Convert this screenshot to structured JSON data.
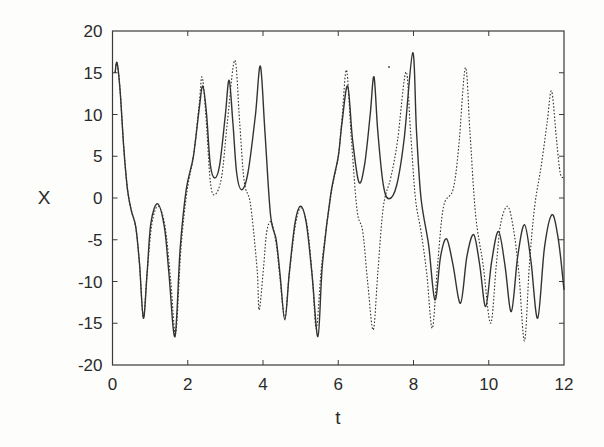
{
  "chart_data": {
    "type": "line",
    "title": "",
    "xlabel": "t",
    "ylabel": "X",
    "xlim": [
      0,
      12
    ],
    "ylim": [
      -20,
      20
    ],
    "xticks": [
      0,
      2,
      4,
      6,
      8,
      10,
      12
    ],
    "yticks": [
      -20,
      -15,
      -10,
      -5,
      0,
      5,
      10,
      15,
      20
    ],
    "xtick_labels": [
      "0",
      "2",
      "4",
      "6",
      "8",
      "10",
      "12"
    ],
    "ytick_labels": [
      "-20",
      "-15",
      "-10",
      "-5",
      "0",
      "5",
      "10",
      "15",
      "20"
    ],
    "grid": false,
    "legend": null,
    "series": [
      {
        "name": "solid",
        "style": "solid",
        "color": "#333333",
        "points": [
          [
            0.07,
            15.0
          ],
          [
            0.12,
            16.2
          ],
          [
            0.2,
            13.0
          ],
          [
            0.3,
            6.0
          ],
          [
            0.4,
            1.0
          ],
          [
            0.5,
            -1.5
          ],
          [
            0.62,
            -3.5
          ],
          [
            0.72,
            -8.0
          ],
          [
            0.82,
            -14.4
          ],
          [
            0.92,
            -9.0
          ],
          [
            1.02,
            -3.0
          ],
          [
            1.2,
            -0.7
          ],
          [
            1.38,
            -3.5
          ],
          [
            1.5,
            -9.0
          ],
          [
            1.66,
            -16.6
          ],
          [
            1.8,
            -6.0
          ],
          [
            1.96,
            1.0
          ],
          [
            2.15,
            5.0
          ],
          [
            2.3,
            10.5
          ],
          [
            2.4,
            13.4
          ],
          [
            2.5,
            10.0
          ],
          [
            2.6,
            4.0
          ],
          [
            2.72,
            2.4
          ],
          [
            2.85,
            4.0
          ],
          [
            3.0,
            10.0
          ],
          [
            3.1,
            14.1
          ],
          [
            3.2,
            9.0
          ],
          [
            3.3,
            3.0
          ],
          [
            3.43,
            1.0
          ],
          [
            3.6,
            3.0
          ],
          [
            3.8,
            10.0
          ],
          [
            3.93,
            15.8
          ],
          [
            4.05,
            8.0
          ],
          [
            4.2,
            -2.0
          ],
          [
            4.35,
            -5.0
          ],
          [
            4.45,
            -9.0
          ],
          [
            4.58,
            -14.6
          ],
          [
            4.7,
            -9.0
          ],
          [
            4.85,
            -3.0
          ],
          [
            5.0,
            -1.0
          ],
          [
            5.15,
            -3.0
          ],
          [
            5.3,
            -9.0
          ],
          [
            5.46,
            -16.6
          ],
          [
            5.58,
            -8.0
          ],
          [
            5.8,
            0.4
          ],
          [
            6.0,
            5.0
          ],
          [
            6.1,
            9.0
          ],
          [
            6.25,
            13.4
          ],
          [
            6.38,
            7.0
          ],
          [
            6.55,
            1.9
          ],
          [
            6.7,
            4.0
          ],
          [
            6.85,
            10.0
          ],
          [
            6.95,
            14.5
          ],
          [
            7.05,
            8.0
          ],
          [
            7.2,
            1.5
          ],
          [
            7.35,
            -0.1
          ],
          [
            7.55,
            1.5
          ],
          [
            7.75,
            7.0
          ],
          [
            7.98,
            17.4
          ],
          [
            8.08,
            8.0
          ],
          [
            8.2,
            0.0
          ],
          [
            8.4,
            -5.6
          ],
          [
            8.57,
            -12.2
          ],
          [
            8.72,
            -7.0
          ],
          [
            8.88,
            -4.9
          ],
          [
            9.05,
            -8.0
          ],
          [
            9.25,
            -12.6
          ],
          [
            9.42,
            -7.0
          ],
          [
            9.6,
            -4.4
          ],
          [
            9.76,
            -8.0
          ],
          [
            9.92,
            -13.0
          ],
          [
            10.08,
            -7.5
          ],
          [
            10.26,
            -4.0
          ],
          [
            10.43,
            -8.0
          ],
          [
            10.6,
            -13.6
          ],
          [
            10.77,
            -7.0
          ],
          [
            10.95,
            -3.2
          ],
          [
            11.12,
            -7.5
          ],
          [
            11.3,
            -14.4
          ],
          [
            11.48,
            -6.0
          ],
          [
            11.68,
            -2.0
          ],
          [
            11.85,
            -5.0
          ],
          [
            12.0,
            -11.0
          ]
        ]
      },
      {
        "name": "dotted",
        "style": "dotted",
        "color": "#333333",
        "points": [
          [
            0.07,
            15.0
          ],
          [
            0.12,
            16.2
          ],
          [
            0.2,
            13.0
          ],
          [
            0.3,
            6.0
          ],
          [
            0.4,
            1.0
          ],
          [
            0.5,
            -1.5
          ],
          [
            0.62,
            -3.5
          ],
          [
            0.72,
            -8.0
          ],
          [
            0.82,
            -14.3
          ],
          [
            0.92,
            -9.0
          ],
          [
            1.05,
            -3.0
          ],
          [
            1.22,
            -1.0
          ],
          [
            1.4,
            -3.5
          ],
          [
            1.55,
            -10.0
          ],
          [
            1.68,
            -16.2
          ],
          [
            1.82,
            -6.0
          ],
          [
            1.98,
            0.8
          ],
          [
            2.15,
            5.0
          ],
          [
            2.3,
            11.0
          ],
          [
            2.38,
            14.5
          ],
          [
            2.48,
            10.0
          ],
          [
            2.6,
            2.0
          ],
          [
            2.72,
            0.4
          ],
          [
            2.9,
            2.5
          ],
          [
            3.05,
            9.0
          ],
          [
            3.25,
            16.5
          ],
          [
            3.38,
            9.0
          ],
          [
            3.5,
            2.0
          ],
          [
            3.65,
            -0.3
          ],
          [
            3.75,
            -4.0
          ],
          [
            3.85,
            -9.0
          ],
          [
            3.9,
            -13.4
          ],
          [
            4.02,
            -8.0
          ],
          [
            4.1,
            -4.0
          ],
          [
            4.22,
            -2.9
          ],
          [
            4.35,
            -5.5
          ],
          [
            4.45,
            -9.5
          ],
          [
            4.58,
            -14.4
          ],
          [
            4.7,
            -9.0
          ],
          [
            4.87,
            -3.0
          ],
          [
            5.02,
            -1.2
          ],
          [
            5.18,
            -3.5
          ],
          [
            5.32,
            -10.0
          ],
          [
            5.42,
            -15.6
          ],
          [
            5.56,
            -8.0
          ],
          [
            5.8,
            0.2
          ],
          [
            6.0,
            5.0
          ],
          [
            6.1,
            9.5
          ],
          [
            6.22,
            15.3
          ],
          [
            6.35,
            7.0
          ],
          [
            6.5,
            -1.5
          ],
          [
            6.65,
            -4.0
          ],
          [
            6.78,
            -10.0
          ],
          [
            6.93,
            -15.8
          ],
          [
            7.05,
            -9.0
          ],
          [
            7.2,
            -1.0
          ],
          [
            7.4,
            2.5
          ],
          [
            7.58,
            7.0
          ],
          [
            7.8,
            15.1
          ],
          [
            7.92,
            8.0
          ],
          [
            8.05,
            0.0
          ],
          [
            8.2,
            -4.0
          ],
          [
            8.35,
            -9.0
          ],
          [
            8.5,
            -15.6
          ],
          [
            8.64,
            -8.0
          ],
          [
            8.8,
            -1.0
          ],
          [
            9.05,
            1.0
          ],
          [
            9.2,
            6.0
          ],
          [
            9.38,
            15.6
          ],
          [
            9.5,
            8.0
          ],
          [
            9.65,
            -2.0
          ],
          [
            9.85,
            -8.0
          ],
          [
            10.05,
            -15.0
          ],
          [
            10.2,
            -8.0
          ],
          [
            10.32,
            -3.0
          ],
          [
            10.5,
            -1.0
          ],
          [
            10.65,
            -3.5
          ],
          [
            10.8,
            -9.0
          ],
          [
            10.95,
            -17.1
          ],
          [
            11.08,
            -8.0
          ],
          [
            11.22,
            -1.0
          ],
          [
            11.4,
            4.0
          ],
          [
            11.55,
            9.0
          ],
          [
            11.67,
            12.8
          ],
          [
            11.8,
            7.0
          ],
          [
            11.9,
            3.0
          ],
          [
            12.0,
            2.4
          ]
        ]
      }
    ]
  },
  "plot": {
    "left": 112.5,
    "right": 564,
    "top": 31,
    "bottom": 365,
    "axis_color": "#3a3a3a",
    "line_color": "#333333",
    "background": "#fdfdfb"
  }
}
